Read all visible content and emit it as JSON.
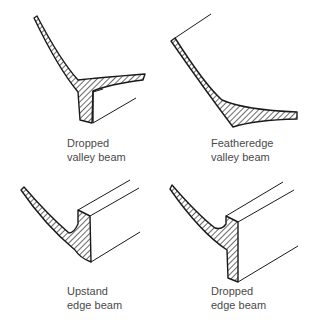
{
  "diagram": {
    "panels": [
      {
        "id": "dropped-valley-beam",
        "label_line1": "Dropped",
        "label_line2": "valley beam"
      },
      {
        "id": "featheredge-valley-beam",
        "label_line1": "Featheredge",
        "label_line2": "valley beam"
      },
      {
        "id": "upstand-edge-beam",
        "label_line1": "Upstand",
        "label_line2": "edge beam"
      },
      {
        "id": "dropped-edge-beam",
        "label_line1": "Dropped",
        "label_line2": "edge beam"
      }
    ],
    "colors": {
      "stroke": "#1a1a1a",
      "text": "#4a4a4a",
      "background": "#ffffff"
    }
  }
}
